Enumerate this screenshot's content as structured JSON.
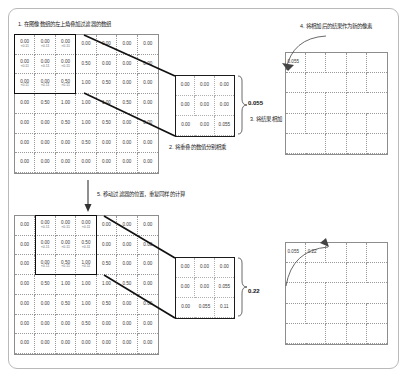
{
  "figure": {
    "type": "convolution-illustration"
  },
  "captions": {
    "step1": "1. 在图像数组的左上角叠加过滤器的数组",
    "step2": "2. 将重叠的数值分别相乘",
    "step3": "3. 将结果相加",
    "step4": "4. 将相加后的结果作为新的像素",
    "step5": "5. 移动过滤器的位置，重复同样的计算"
  },
  "colors": {
    "panel_border": "#b9b9b9",
    "grid_line": "#9a9a9a",
    "window_stroke": "#0d0d0d",
    "text": "#3a3a3a",
    "multiplier_text": "#6a6a6a"
  },
  "stage1": {
    "input_grid": {
      "rows": 7,
      "cols": 7,
      "values": [
        [
          "0.00",
          "0.00",
          "0.00",
          "0.00",
          "0.00",
          "0.00",
          "0.00"
        ],
        [
          "0.00",
          "0.00",
          "0.00",
          "0.50",
          "0.00",
          "0.00",
          "0.00"
        ],
        [
          "0.00",
          "0.00",
          "0.50",
          "1.00",
          "0.50",
          "0.00",
          "0.00"
        ],
        [
          "0.00",
          "0.50",
          "1.00",
          "1.00",
          "1.00",
          "0.50",
          "0.00"
        ],
        [
          "0.00",
          "0.00",
          "0.50",
          "1.00",
          "0.50",
          "0.00",
          "0.00"
        ],
        [
          "0.00",
          "0.00",
          "0.00",
          "0.50",
          "0.00",
          "0.00",
          "0.00"
        ],
        [
          "0.00",
          "0.00",
          "0.00",
          "0.00",
          "0.00",
          "0.00",
          "0.00"
        ]
      ],
      "multipliers": [
        [
          "×0.11",
          "×0.11",
          "×0.11",
          "",
          "",
          "",
          ""
        ],
        [
          "×0.11",
          "×0.11",
          "×0.11",
          "",
          "",
          "",
          ""
        ],
        [
          "×0.11",
          "×0.11",
          "×0.11",
          "",
          "",
          "",
          ""
        ],
        [
          "",
          "",
          "",
          "",
          "",
          "",
          ""
        ],
        [
          "",
          "",
          "",
          "",
          "",
          "",
          ""
        ],
        [
          "",
          "",
          "",
          "",
          "",
          "",
          ""
        ],
        [
          "",
          "",
          "",
          "",
          "",
          "",
          ""
        ]
      ],
      "window": {
        "row": 0,
        "col": 0,
        "size": 3
      }
    },
    "product_grid": {
      "rows": 3,
      "cols": 3,
      "values": [
        [
          "0.00",
          "0.00",
          "0.00"
        ],
        [
          "0.00",
          "0.00",
          "0.00"
        ],
        [
          "0.00",
          "0.00",
          "0.055"
        ]
      ]
    },
    "sum": "0.055",
    "output_grid": {
      "rows": 5,
      "cols": 5,
      "values": [
        [
          "0.055",
          "",
          "",
          "",
          ""
        ],
        [
          "",
          "",
          "",
          "",
          ""
        ],
        [
          "",
          "",
          "",
          "",
          ""
        ],
        [
          "",
          "",
          "",
          "",
          ""
        ],
        [
          "",
          "",
          "",
          "",
          ""
        ]
      ]
    }
  },
  "stage2": {
    "input_grid": {
      "rows": 7,
      "cols": 7,
      "values": [
        [
          "0.00",
          "0.00",
          "0.00",
          "0.00",
          "0.00",
          "0.00",
          "0.00"
        ],
        [
          "0.00",
          "0.00",
          "0.00",
          "0.50",
          "0.00",
          "0.00",
          "0.00"
        ],
        [
          "0.00",
          "0.00",
          "0.50",
          "1.00",
          "0.50",
          "0.00",
          "0.00"
        ],
        [
          "0.00",
          "0.50",
          "1.00",
          "1.00",
          "1.00",
          "0.50",
          "0.00"
        ],
        [
          "0.00",
          "0.00",
          "0.50",
          "1.00",
          "0.50",
          "0.00",
          "0.00"
        ],
        [
          "0.00",
          "0.00",
          "0.00",
          "0.50",
          "0.00",
          "0.00",
          "0.00"
        ],
        [
          "0.00",
          "0.00",
          "0.00",
          "0.00",
          "0.00",
          "0.00",
          "0.00"
        ]
      ],
      "multipliers": [
        [
          "",
          "×0.11",
          "×0.11",
          "×0.11",
          "",
          "",
          ""
        ],
        [
          "",
          "×0.11",
          "×0.11",
          "×0.11",
          "",
          "",
          ""
        ],
        [
          "",
          "×0.11",
          "×0.11",
          "×0.11",
          "",
          "",
          ""
        ],
        [
          "",
          "",
          "",
          "",
          "",
          "",
          ""
        ],
        [
          "",
          "",
          "",
          "",
          "",
          "",
          ""
        ],
        [
          "",
          "",
          "",
          "",
          "",
          "",
          ""
        ],
        [
          "",
          "",
          "",
          "",
          "",
          "",
          ""
        ]
      ],
      "window": {
        "row": 0,
        "col": 1,
        "size": 3
      }
    },
    "product_grid": {
      "rows": 3,
      "cols": 3,
      "values": [
        [
          "0.00",
          "0.00",
          "0.00"
        ],
        [
          "0.00",
          "0.00",
          "0.055"
        ],
        [
          "0.00",
          "0.055",
          "0.11"
        ]
      ]
    },
    "sum": "0.22",
    "output_grid": {
      "rows": 5,
      "cols": 5,
      "values": [
        [
          "0.055",
          "0.22",
          "",
          "",
          ""
        ],
        [
          "",
          "",
          "",
          "",
          ""
        ],
        [
          "",
          "",
          "",
          "",
          ""
        ],
        [
          "",
          "",
          "",
          "",
          ""
        ],
        [
          "",
          "",
          "",
          "",
          ""
        ]
      ]
    }
  }
}
